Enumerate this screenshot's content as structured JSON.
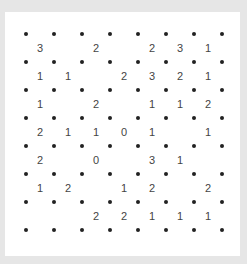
{
  "puzzle": {
    "type": "slitherlink",
    "dots_per_side": 8,
    "cells_per_side": 7,
    "colors": {
      "background": "#e6e6e6",
      "board": "#ffffff",
      "dot": "#222222",
      "clue": "#444444"
    },
    "clues": [
      [
        "3",
        "",
        "2",
        "",
        "2",
        "3",
        "1"
      ],
      [
        "1",
        "1",
        "",
        "2",
        "3",
        "2",
        "1"
      ],
      [
        "1",
        "",
        "2",
        "",
        "1",
        "1",
        "2"
      ],
      [
        "2",
        "1",
        "1",
        "0",
        "1",
        "",
        "1"
      ],
      [
        "2",
        "",
        "0",
        "",
        "3",
        "1",
        ""
      ],
      [
        "1",
        "2",
        "",
        "1",
        "2",
        "",
        "2"
      ],
      [
        "",
        "",
        "2",
        "2",
        "1",
        "1",
        "1"
      ]
    ]
  }
}
